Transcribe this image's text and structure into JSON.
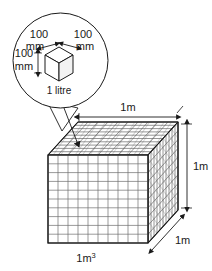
{
  "figure": {
    "caption": "1m",
    "caption_superscript": "3"
  },
  "callout": {
    "name": "magnifier-callout",
    "cube_label": "1 litre",
    "dimensions": [
      {
        "id": "top-left",
        "value": "100",
        "unit": "mm"
      },
      {
        "id": "top-right",
        "value": "100",
        "unit": "mm"
      },
      {
        "id": "left-vertical",
        "value": "100",
        "unit": "mm"
      }
    ]
  },
  "big_cube": {
    "name": "cubic-metre",
    "dimensions": [
      {
        "id": "width",
        "label": "1m"
      },
      {
        "id": "height",
        "label": "1m"
      },
      {
        "id": "depth",
        "label": "1m"
      }
    ],
    "grid_divisions": 10
  },
  "colors": {
    "outline": "#1a1a1a",
    "grid": "#6e6e6e",
    "hatch": "#8a8a8a",
    "background": "#ffffff"
  }
}
